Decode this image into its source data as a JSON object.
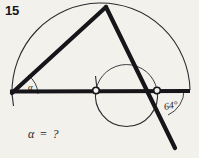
{
  "figure": {
    "problem_number": "15",
    "question": "α = ?",
    "labels": {
      "unknown_angle": "α",
      "known_angle": "64°"
    },
    "colors": {
      "paper": "#f3f1ec",
      "ink": "#16161a",
      "thin_ink": "#3a3a3e"
    },
    "geometry": {
      "type": "circle-geometry-diagram",
      "description": "Triangle inscribed with a large semicircle and a smaller circle; inscribed angle alpha at left vertex, 64 degree angle at right intersection point.",
      "points": {
        "left_vertex": [
          12,
          94
        ],
        "apex": [
          106,
          7
        ],
        "right_point": [
          157,
          90
        ],
        "center_marker": [
          96,
          90
        ],
        "line_end_right": [
          190,
          90
        ],
        "ray_end": [
          175,
          148
        ]
      },
      "large_arc": {
        "center": [
          101,
          93
        ],
        "radius": 89,
        "start_angle_deg": 181,
        "end_angle_deg": 359
      },
      "small_arc": {
        "center": [
          127,
          91
        ],
        "radius": 31,
        "note": "circle passing through center marker and right point, drawn below the baseline"
      },
      "known_angle_value": 64,
      "arc_marks": [
        {
          "name": "alpha-arc",
          "at": [
            12,
            94
          ],
          "radius": 26
        },
        {
          "name": "known-angle-arc",
          "at": [
            157,
            90
          ],
          "radius": 27
        }
      ]
    }
  }
}
